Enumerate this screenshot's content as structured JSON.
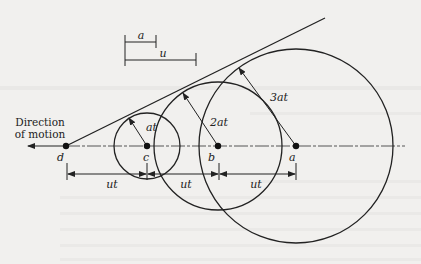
{
  "diagram": {
    "direction_label_line1": "Direction",
    "direction_label_line2": "of motion",
    "scale_bars": {
      "a_label": "a",
      "u_label": "u"
    },
    "points": {
      "d": "d",
      "c": "c",
      "b": "b",
      "a": "a"
    },
    "radii": {
      "c_radius": "at",
      "b_radius": "2at",
      "a_radius": "3at"
    },
    "spacing": {
      "dc": "ut",
      "cb": "ut",
      "ba": "ut"
    },
    "colors": {
      "ink": "#222222",
      "paper": "#f1f0ee",
      "axis": "#555555"
    }
  }
}
